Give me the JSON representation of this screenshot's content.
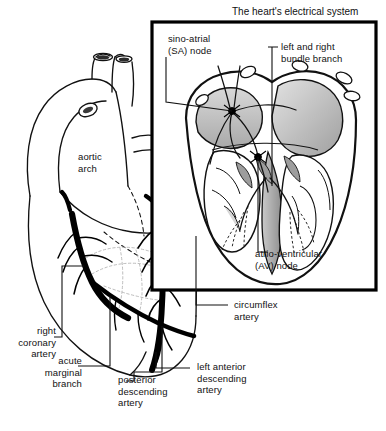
{
  "figure": {
    "kind": "anatomical-illustration",
    "background_color": "#ffffff",
    "ink_color": "#111111",
    "artery_color": "#000000",
    "shade_gray": "#b8b8b8",
    "shade_light": "#dedede"
  },
  "inset": {
    "title": "The heart's electrical system",
    "border_color": "#000000",
    "box": {
      "x": 152,
      "y": 22,
      "w": 224,
      "h": 268
    }
  },
  "labels": {
    "sa_node": "sino-atrial\n(SA) node",
    "bundle_branch": "left and right\nbundle branch",
    "av_node": "atrio-ventricular\n(AV) node",
    "aortic_arch": "aortic\narch",
    "circumflex_artery": "circumflex\nartery",
    "right_coronary_artery": "right\ncoronary\nartery",
    "acute_marginal_branch": "acute\nmarginal\nbranch",
    "posterior_descending_artery": "posterior\ndescending\nartery",
    "left_anterior_descending_artery": "left anterior\ndescending\nartery"
  },
  "structures": {
    "main_view": [
      "aortic arch",
      "superior vena cava",
      "pulmonary artery",
      "right atrium",
      "right ventricle",
      "left ventricle",
      "right coronary artery",
      "acute marginal branch",
      "posterior descending artery",
      "left anterior descending artery",
      "circumflex artery"
    ],
    "inset_view": [
      "sino-atrial (SA) node",
      "atrio-ventricular (AV) node",
      "left and right bundle branch",
      "Purkinje fibres",
      "right atrium",
      "left atrium",
      "right ventricle",
      "left ventricle",
      "interventricular septum"
    ]
  }
}
